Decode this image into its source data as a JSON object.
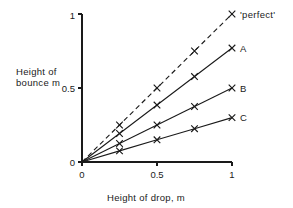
{
  "chart_data": {
    "type": "line",
    "title": "",
    "xlabel": "Height of drop, m",
    "ylabel_line1": "Height of",
    "ylabel_line2": "bounce  m",
    "xlim": [
      0,
      1
    ],
    "ylim": [
      0,
      1
    ],
    "xticks": [
      "0",
      "0.5",
      "1"
    ],
    "xtick_values": [
      0,
      0.5,
      1
    ],
    "yticks": [
      "0",
      "0.5",
      "1"
    ],
    "ytick_values": [
      0,
      0.5,
      1
    ],
    "grid": false,
    "legend_position": "right-of-line-ends",
    "marker": "x",
    "x": [
      0,
      0.25,
      0.5,
      0.75,
      1
    ],
    "series": [
      {
        "name": "'perfect'",
        "label": "'perfect'",
        "style": "dashed",
        "slope": 1.0,
        "values": [
          0,
          0.25,
          0.5,
          0.75,
          1.0
        ],
        "marker_x": [
          0.25,
          0.5,
          0.75,
          1.0
        ]
      },
      {
        "name": "A",
        "label": "A",
        "style": "solid",
        "slope": 0.77,
        "values": [
          0,
          0.1925,
          0.385,
          0.5775,
          0.77
        ],
        "marker_x": [
          0.25,
          0.5,
          0.75,
          1.0
        ]
      },
      {
        "name": "B",
        "label": "B",
        "style": "solid",
        "slope": 0.5,
        "values": [
          0,
          0.125,
          0.25,
          0.375,
          0.5
        ],
        "marker_x": [
          0.25,
          0.5,
          0.75,
          1.0
        ]
      },
      {
        "name": "C",
        "label": "C",
        "style": "solid",
        "slope": 0.3,
        "values": [
          0,
          0.075,
          0.15,
          0.225,
          0.3
        ],
        "marker_x": [
          0.25,
          0.5,
          0.75,
          1.0
        ]
      }
    ],
    "colors": {
      "ink": "#1a1a1a",
      "background": "#ffffff"
    }
  }
}
